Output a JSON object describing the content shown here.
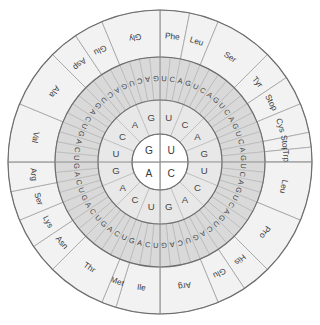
{
  "diagram": {
    "type": "circular-codon-table",
    "center": {
      "x": 160,
      "y": 162
    },
    "rings": [
      {
        "name": "first-base",
        "index": 1,
        "radius_inner": 0,
        "radius_outer": 28,
        "segments": 4,
        "fill": "#ffffff"
      },
      {
        "name": "second-base",
        "index": 2,
        "radius_inner": 28,
        "radius_outer": 62,
        "segments": 16,
        "fill": "#e8e8e8"
      },
      {
        "name": "third-base",
        "index": 3,
        "radius_inner": 62,
        "radius_outer": 105,
        "segments": 64,
        "fill": "#d9d9d9"
      },
      {
        "name": "amino-acid",
        "index": 4,
        "radius_inner": 105,
        "radius_outer": 152,
        "segments": 25,
        "fill": "#f2f2f2"
      }
    ]
  },
  "ring1_bases": [
    {
      "base": "U",
      "quadrant": "top-right",
      "start_deg": 0,
      "end_deg": 90
    },
    {
      "base": "C",
      "quadrant": "bottom-right",
      "start_deg": 90,
      "end_deg": 180
    },
    {
      "base": "A",
      "quadrant": "bottom-left",
      "start_deg": 180,
      "end_deg": 270
    },
    {
      "base": "G",
      "quadrant": "top-left",
      "start_deg": 270,
      "end_deg": 360
    }
  ],
  "ring2_bases": [
    "U",
    "C",
    "A",
    "G",
    "U",
    "C",
    "A",
    "G",
    "U",
    "C",
    "A",
    "G",
    "U",
    "C",
    "A",
    "G"
  ],
  "ring3_bases": [
    "U",
    "C",
    "A",
    "G",
    "U",
    "C",
    "A",
    "G",
    "U",
    "C",
    "A",
    "G",
    "U",
    "C",
    "A",
    "G",
    "U",
    "C",
    "A",
    "G",
    "U",
    "C",
    "A",
    "G",
    "U",
    "C",
    "A",
    "G",
    "U",
    "C",
    "A",
    "G",
    "U",
    "C",
    "A",
    "G",
    "U",
    "C",
    "A",
    "G",
    "U",
    "C",
    "A",
    "G",
    "U",
    "C",
    "A",
    "G",
    "U",
    "C",
    "A",
    "G",
    "U",
    "C",
    "A",
    "G",
    "U",
    "C",
    "A",
    "G",
    "U",
    "C",
    "A",
    "G"
  ],
  "ring4_amino_acids": [
    {
      "label": "Phe",
      "codon_span": 2,
      "start_index": 0
    },
    {
      "label": "Leu",
      "codon_span": 2,
      "start_index": 2
    },
    {
      "label": "Ser",
      "codon_span": 4,
      "start_index": 4
    },
    {
      "label": "Tyr",
      "codon_span": 2,
      "start_index": 8
    },
    {
      "label": "Stop",
      "codon_span": 2,
      "start_index": 10
    },
    {
      "label": "Cys",
      "codon_span": 2,
      "start_index": 12
    },
    {
      "label": "Stop",
      "codon_span": 1,
      "start_index": 14
    },
    {
      "label": "Trp",
      "codon_span": 1,
      "start_index": 15
    },
    {
      "label": "Leu",
      "codon_span": 4,
      "start_index": 16
    },
    {
      "label": "Pro",
      "codon_span": 4,
      "start_index": 20
    },
    {
      "label": "His",
      "codon_span": 2,
      "start_index": 24
    },
    {
      "label": "Glu",
      "codon_span": 2,
      "start_index": 26
    },
    {
      "label": "Arg",
      "codon_span": 4,
      "start_index": 28
    },
    {
      "label": "Ile",
      "codon_span": 3,
      "start_index": 32
    },
    {
      "label": "Met",
      "codon_span": 1,
      "start_index": 35
    },
    {
      "label": "Thr",
      "codon_span": 4,
      "start_index": 36
    },
    {
      "label": "Asn",
      "codon_span": 2,
      "start_index": 40
    },
    {
      "label": "Lys",
      "codon_span": 2,
      "start_index": 42
    },
    {
      "label": "Ser",
      "codon_span": 2,
      "start_index": 44
    },
    {
      "label": "Arg",
      "codon_span": 2,
      "start_index": 46
    },
    {
      "label": "Val",
      "codon_span": 4,
      "start_index": 48
    },
    {
      "label": "Ala",
      "codon_span": 4,
      "start_index": 52
    },
    {
      "label": "Asp",
      "codon_span": 2,
      "start_index": 56
    },
    {
      "label": "Glu",
      "codon_span": 2,
      "start_index": 58
    },
    {
      "label": "Gly",
      "codon_span": 4,
      "start_index": 60
    }
  ],
  "colors": {
    "ring1_fill": "#ffffff",
    "ring2_fill": "#e8e8e8",
    "ring3_fill": "#d9d9d9",
    "ring4_fill": "#f2f2f2",
    "stroke_light": "#a8a8a8",
    "stroke_dark": "#6d6d6d",
    "text": "#3a3a3a",
    "background": "#ffffff"
  }
}
